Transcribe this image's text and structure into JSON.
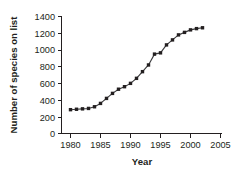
{
  "chart_data": {
    "type": "line",
    "title": "",
    "xlabel": "Year",
    "ylabel": "Number of species on list",
    "xlim": [
      1978,
      2006
    ],
    "ylim": [
      0,
      1400
    ],
    "xticks": [
      1980,
      1985,
      1990,
      1995,
      2000,
      2005
    ],
    "yticks": [
      0,
      200,
      400,
      600,
      800,
      1000,
      1200,
      1400
    ],
    "grid": false,
    "legend": null,
    "marker": "filled-square",
    "series": [
      {
        "name": "Number of species on list",
        "x": [
          1980,
          1981,
          1982,
          1983,
          1984,
          1985,
          1986,
          1987,
          1988,
          1989,
          1990,
          1991,
          1992,
          1993,
          1994,
          1995,
          1996,
          1997,
          1998,
          1999,
          2000,
          2001,
          2002
        ],
        "values": [
          285,
          290,
          295,
          300,
          320,
          360,
          420,
          480,
          530,
          560,
          600,
          660,
          740,
          820,
          950,
          965,
          1060,
          1120,
          1180,
          1210,
          1240,
          1255,
          1265
        ]
      }
    ]
  },
  "labels": {
    "y_0": "0",
    "y_200": "200",
    "y_400": "400",
    "y_600": "600",
    "y_800": "800",
    "y_1000": "1000",
    "y_1200": "1200",
    "y_1400": "1400",
    "x_1980": "1980",
    "x_1985": "1985",
    "x_1990": "1990",
    "x_1995": "1995",
    "x_2000": "2000",
    "x_2005": "2005",
    "axis_title_x": "Year",
    "axis_title_y": "Number of species on list"
  }
}
